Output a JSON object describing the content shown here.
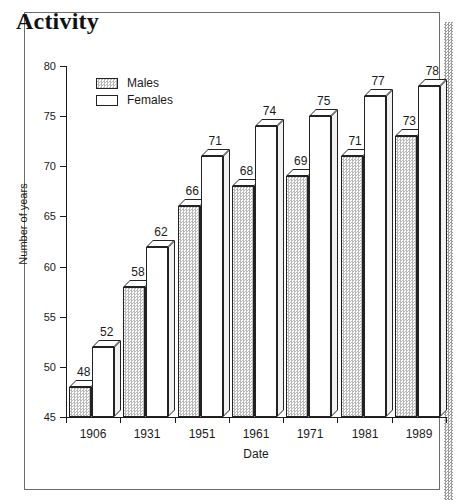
{
  "page": {
    "title": "Activity"
  },
  "legend": {
    "position": "inside-top-left",
    "entries": [
      {
        "label": "Males",
        "fill": "stipple"
      },
      {
        "label": "Females",
        "fill": "white"
      }
    ]
  },
  "axes": {
    "y_title": "Number of years",
    "x_title": "Date",
    "y_ticks": [
      80,
      75,
      70,
      65,
      60,
      55,
      50,
      45
    ],
    "y_min": 45,
    "y_max": 80
  },
  "chart_data": {
    "type": "bar",
    "title": "Activity",
    "xlabel": "Date",
    "ylabel": "Number of years",
    "ylim": [
      45,
      80
    ],
    "ytick_step": 5,
    "grid": false,
    "legend_position": "upper left (inside plot)",
    "categories": [
      "1906",
      "1931",
      "1951",
      "1961",
      "1971",
      "1981",
      "1989"
    ],
    "series": [
      {
        "name": "Males",
        "values": [
          48,
          58,
          66,
          68,
          69,
          71,
          73
        ]
      },
      {
        "name": "Females",
        "values": [
          52,
          62,
          71,
          74,
          75,
          77,
          78
        ]
      }
    ],
    "data_labels": true,
    "style": "3d-isometric grouped bars"
  }
}
